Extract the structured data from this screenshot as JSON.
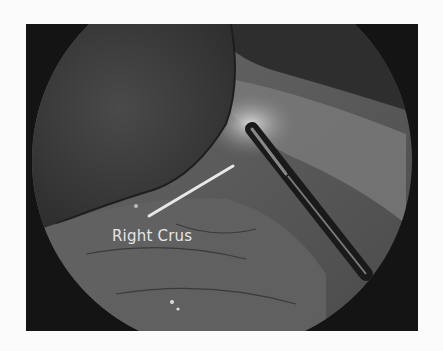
{
  "figure": {
    "annotation": {
      "label": "Right Crus",
      "pointer_color": "#e8e8e8"
    },
    "colors": {
      "background": "#fbfbfb",
      "frame": "#141414",
      "liver": "#3a3a3a",
      "tissue": "#5e5e5e"
    }
  }
}
